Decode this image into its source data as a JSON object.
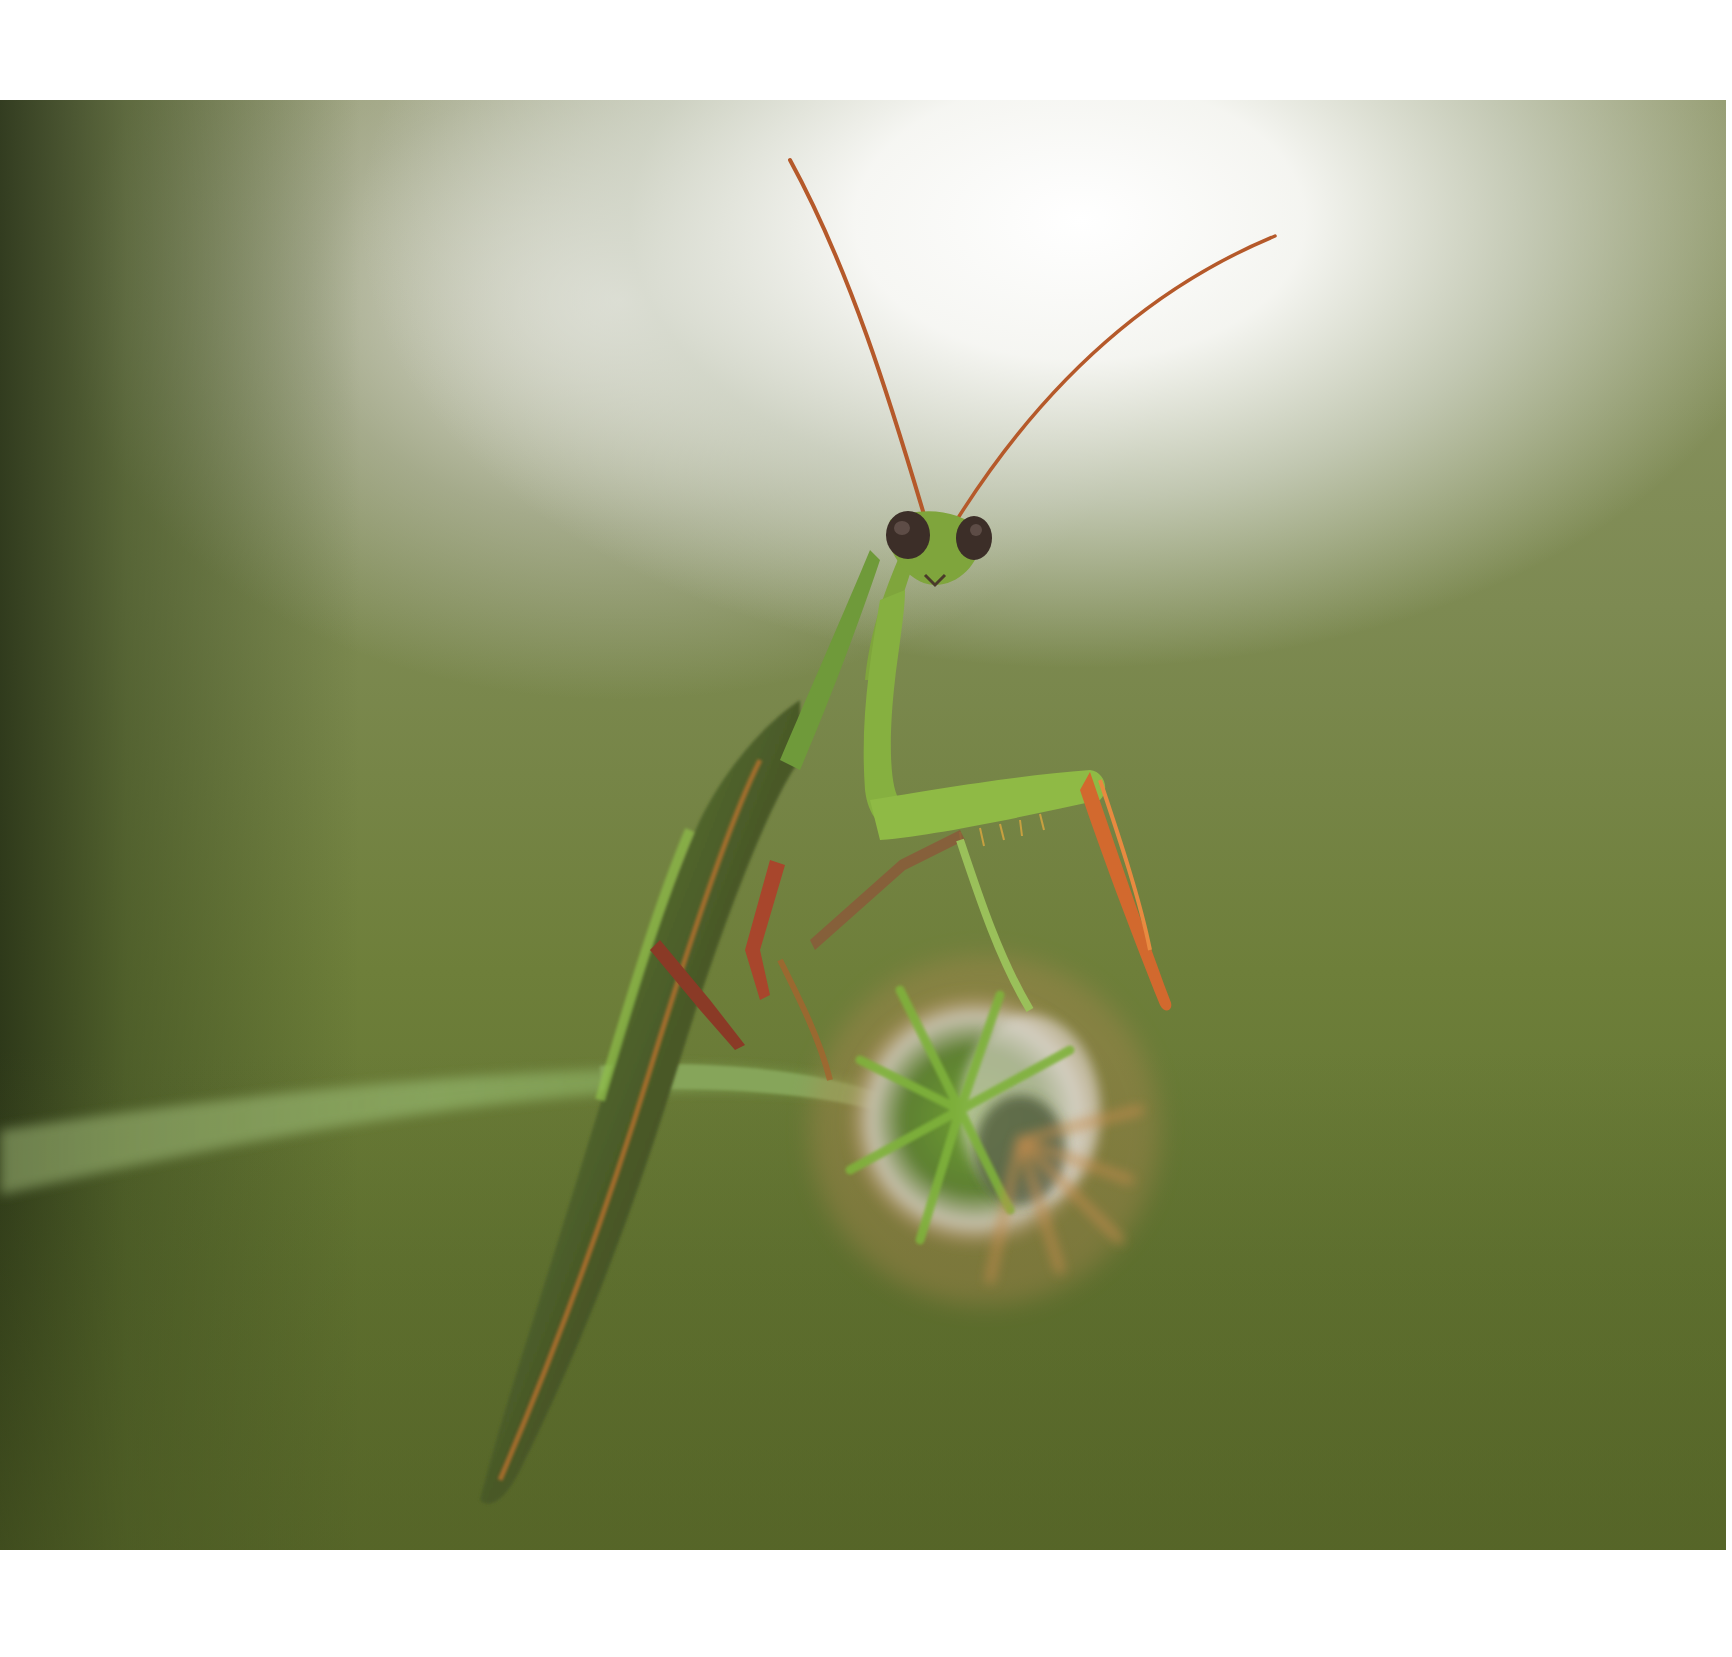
{
  "image": {
    "subject": "praying mantis on a teasel stem",
    "description": "Green praying mantis perched on a thin stem with a spiky seed head, looking toward the camera, against a blurred green background with a bright white glow in the upper area",
    "colors": {
      "page_background": "#ffffff",
      "background_dark_green": "#5d6d2e",
      "background_mid_green": "#7d8a52",
      "highlight": "#ffffff",
      "mantis_green": "#7fa53c",
      "mantis_dark": "#3a3a22",
      "antenna_orange": "#b5592a",
      "leg_orange": "#d2692e",
      "seed_head_green": "#7fb23a",
      "eye_brown": "#3c2e28"
    }
  }
}
